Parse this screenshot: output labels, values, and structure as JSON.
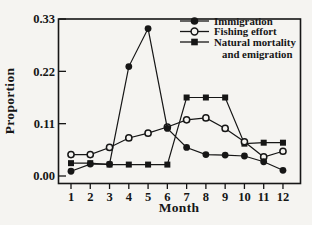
{
  "figure": {
    "background": "#f5f4f1",
    "ink": "#161616"
  },
  "chart_data": {
    "type": "line",
    "title": "",
    "xlabel": "Month",
    "ylabel": "Proportion",
    "x": [
      1,
      2,
      3,
      4,
      5,
      6,
      7,
      8,
      9,
      10,
      11,
      12
    ],
    "x_tick_labels": [
      "1",
      "2",
      "3",
      "4",
      "5",
      "6",
      "7",
      "8",
      "9",
      "10",
      "11",
      "12"
    ],
    "y_tick_labels": [
      "0.00",
      "0.11",
      "0.22",
      "0.33"
    ],
    "y_tick_values": [
      0.0,
      0.11,
      0.22,
      0.33
    ],
    "ylim": [
      -0.016,
      0.33
    ],
    "xlim": [
      0.35,
      12.9
    ],
    "grid": false,
    "legend_position": "top-right-inside",
    "series": [
      {
        "name": "Immigration",
        "marker": "filled-circle",
        "values": [
          0.01,
          0.025,
          0.025,
          0.23,
          0.31,
          0.1,
          0.06,
          0.045,
          0.044,
          0.042,
          0.03,
          0.012
        ]
      },
      {
        "name": "Fishing effort",
        "marker": "open-circle",
        "values": [
          0.045,
          0.045,
          0.06,
          0.08,
          0.09,
          0.103,
          0.118,
          0.122,
          0.1,
          0.072,
          0.04,
          0.052
        ]
      },
      {
        "name": "Natural mortality and emigration",
        "marker": "filled-square",
        "values": [
          0.027,
          0.027,
          0.024,
          0.024,
          0.024,
          0.024,
          0.165,
          0.165,
          0.165,
          0.068,
          0.07,
          0.07
        ]
      }
    ],
    "legend": [
      {
        "label": "Immigration",
        "marker": "filled-circle"
      },
      {
        "label": "Fishing effort",
        "marker": "open-circle"
      },
      {
        "label_line1": "Natural mortality",
        "label_line2": "and emigration",
        "marker": "filled-square"
      }
    ]
  }
}
